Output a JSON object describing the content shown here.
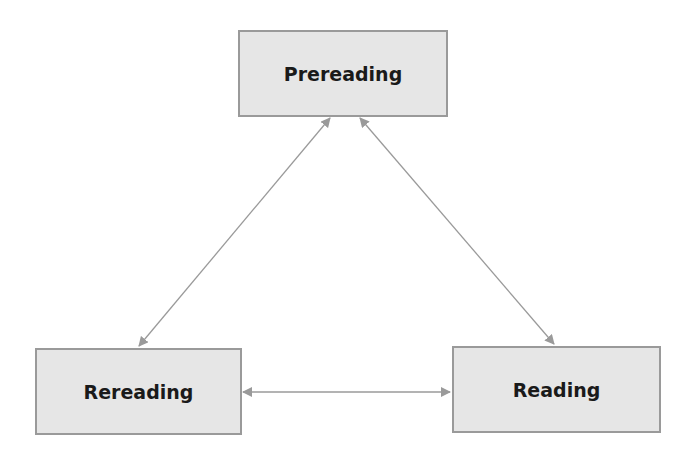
{
  "diagram": {
    "type": "cycle",
    "nodes": [
      {
        "id": "prereading",
        "label": "Prereading"
      },
      {
        "id": "rereading",
        "label": "Rereading"
      },
      {
        "id": "reading",
        "label": "Reading"
      }
    ],
    "edges": [
      {
        "from": "prereading",
        "to": "rereading",
        "direction": "bidirectional"
      },
      {
        "from": "prereading",
        "to": "reading",
        "direction": "bidirectional"
      },
      {
        "from": "rereading",
        "to": "reading",
        "direction": "bidirectional"
      }
    ],
    "colors": {
      "box_fill": "#e6e6e6",
      "box_border": "#9a9a9a",
      "arrow": "#9a9a9a",
      "text": "#1a1a1a"
    }
  }
}
